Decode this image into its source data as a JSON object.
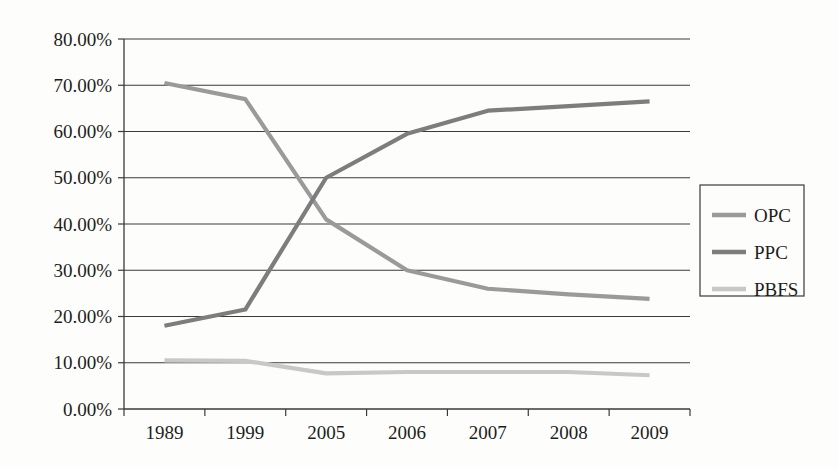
{
  "chart_data": {
    "type": "line",
    "title": "",
    "subtitle": "",
    "xlabel": "",
    "ylabel": "",
    "categories": [
      "1989",
      "1999",
      "2005",
      "2006",
      "2007",
      "2008",
      "2009"
    ],
    "ylim": [
      0,
      80
    ],
    "y_ticks": [
      0,
      10,
      20,
      30,
      40,
      50,
      60,
      70,
      80
    ],
    "y_tick_labels": [
      "0.00%",
      "10.00%",
      "20.00%",
      "30.00%",
      "40.00%",
      "50.00%",
      "60.00%",
      "70.00%",
      "80.00%"
    ],
    "grid": "horizontal",
    "legend_position": "right",
    "series": [
      {
        "name": "OPC",
        "color": "#9a9a9a",
        "values": [
          70.5,
          67.0,
          41.0,
          30.0,
          26.0,
          24.8,
          23.8
        ]
      },
      {
        "name": "PPC",
        "color": "#7d7d7d",
        "values": [
          18.0,
          21.5,
          50.0,
          59.5,
          64.5,
          65.5,
          66.5
        ]
      },
      {
        "name": "PBFS",
        "color": "#c8c8c8",
        "values": [
          10.5,
          10.4,
          7.7,
          8.0,
          8.0,
          8.0,
          7.3
        ]
      }
    ]
  },
  "legend": {
    "entries": [
      {
        "label": "OPC"
      },
      {
        "label": "PPC"
      },
      {
        "label": "PBFS"
      }
    ]
  },
  "colors": {
    "background": "#fdfdfb",
    "axis": "#3a3a3a",
    "text": "#1d1d1d",
    "opc": "#9a9a9a",
    "ppc": "#7d7d7d",
    "pbfs": "#c8c8c8"
  }
}
